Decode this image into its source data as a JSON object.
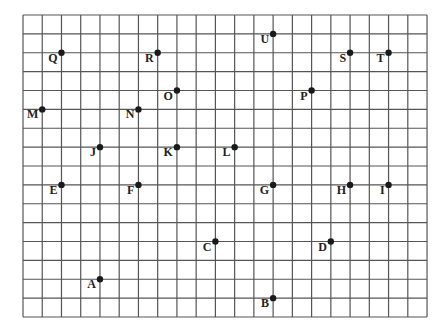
{
  "grid": {
    "origin_x": 23,
    "origin_y": 15,
    "cols": 21,
    "rows": 16,
    "cell_w": 19.24,
    "cell_h": 18.875,
    "line_color": "#555555",
    "dot_color": "#1a1a1a"
  },
  "points": [
    {
      "label": "A",
      "col": 4,
      "row": 14
    },
    {
      "label": "B",
      "col": 13,
      "row": 15
    },
    {
      "label": "C",
      "col": 10,
      "row": 12
    },
    {
      "label": "D",
      "col": 16,
      "row": 12
    },
    {
      "label": "E",
      "col": 2,
      "row": 9
    },
    {
      "label": "F",
      "col": 6,
      "row": 9
    },
    {
      "label": "G",
      "col": 13,
      "row": 9
    },
    {
      "label": "H",
      "col": 17,
      "row": 9
    },
    {
      "label": "I",
      "col": 19,
      "row": 9
    },
    {
      "label": "J",
      "col": 4,
      "row": 7
    },
    {
      "label": "K",
      "col": 8,
      "row": 7
    },
    {
      "label": "L",
      "col": 11,
      "row": 7
    },
    {
      "label": "M",
      "col": 1,
      "row": 5
    },
    {
      "label": "N",
      "col": 6,
      "row": 5
    },
    {
      "label": "O",
      "col": 8,
      "row": 4
    },
    {
      "label": "P",
      "col": 15,
      "row": 4
    },
    {
      "label": "Q",
      "col": 2,
      "row": 2
    },
    {
      "label": "R",
      "col": 7,
      "row": 2
    },
    {
      "label": "S",
      "col": 17,
      "row": 2
    },
    {
      "label": "T",
      "col": 19,
      "row": 2
    },
    {
      "label": "U",
      "col": 13,
      "row": 1
    }
  ]
}
